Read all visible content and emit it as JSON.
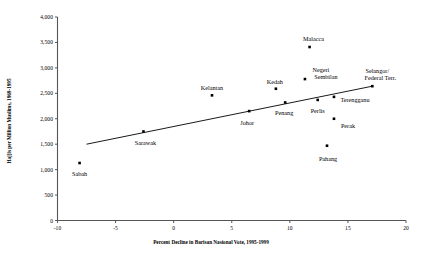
{
  "chart_data": {
    "type": "scatter",
    "title": "",
    "xlabel": "Percent Decline in Barisan Nasional Vote, 1995-1999",
    "ylabel": "Hajjis per Million Muslims, 1969-1995",
    "xlim": [
      -10,
      20
    ],
    "ylim": [
      0,
      4000
    ],
    "xticks": [
      "-10",
      "-5",
      "0",
      "5",
      "10",
      "15",
      "20"
    ],
    "xtick_values": [
      -10,
      -5,
      0,
      5,
      10,
      15,
      20
    ],
    "yticks": [
      "0",
      "500",
      "1,000",
      "1,500",
      "2,000",
      "2,500",
      "3,000",
      "3,500",
      "4,000"
    ],
    "ytick_values": [
      0,
      500,
      1000,
      1500,
      2000,
      2500,
      3000,
      3500,
      4000
    ],
    "grid": false,
    "legend": "none",
    "marker": "filled-square",
    "marker_color": "#000000",
    "points": [
      {
        "label": "Sabah",
        "x": -8.1,
        "y": 1130,
        "label_dx": 0,
        "label_dy": 11,
        "align": "center"
      },
      {
        "label": "Sarawak",
        "x": -2.6,
        "y": 1750,
        "label_dx": 2,
        "label_dy": 12,
        "align": "center"
      },
      {
        "label": "Kelantan",
        "x": 3.3,
        "y": 2460,
        "label_dx": 0,
        "label_dy": -7,
        "align": "center"
      },
      {
        "label": "Johor",
        "x": 6.5,
        "y": 2150,
        "label_dx": -2,
        "label_dy": 12,
        "align": "center"
      },
      {
        "label": "Kedah",
        "x": 8.8,
        "y": 2590,
        "label_dx": -1,
        "label_dy": -7,
        "align": "center"
      },
      {
        "label": "Penang",
        "x": 9.6,
        "y": 2320,
        "label_dx": -1,
        "label_dy": 11,
        "align": "center"
      },
      {
        "label": "Negeri",
        "x": 11.3,
        "y": 2780,
        "label_dx": 16,
        "label_dy": -9,
        "align": "center",
        "label2": "Sembilan",
        "label2_dx": 21,
        "label2_dy": -2
      },
      {
        "label": "Malacca",
        "x": 11.7,
        "y": 3410,
        "label_dx": 4,
        "label_dy": -8,
        "align": "center"
      },
      {
        "label": "Perlis",
        "x": 12.4,
        "y": 2370,
        "label_dx": 0,
        "label_dy": 11,
        "align": "center"
      },
      {
        "label": "Pahang",
        "x": 13.2,
        "y": 1470,
        "label_dx": 1,
        "label_dy": 13,
        "align": "center"
      },
      {
        "label": "Terengganu",
        "x": 13.8,
        "y": 2430,
        "label_dx": 21,
        "label_dy": 3,
        "align": "center"
      },
      {
        "label": "Perak",
        "x": 13.8,
        "y": 2000,
        "label_dx": 14,
        "label_dy": 7,
        "align": "center"
      },
      {
        "label": "Selangor/",
        "x": 17.1,
        "y": 2640,
        "label_dx": 5,
        "label_dy": -15,
        "align": "center",
        "label2": "Federal Terr.",
        "label2_dx": 8,
        "label2_dy": -8
      }
    ],
    "trendline": {
      "name": "linear-fit",
      "x_start": -7.5,
      "y_start": 1500,
      "x_end": 17.1,
      "y_end": 2640
    }
  },
  "axes": {
    "y_axis_name": "vertical-axis",
    "x_axis_name": "horizontal-axis"
  }
}
